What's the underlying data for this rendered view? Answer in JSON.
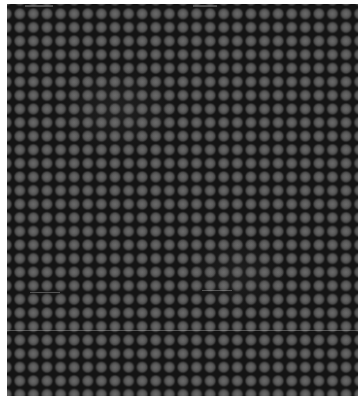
{
  "image": {
    "description": "Grayscale micrograph of a regular square array of round dots on a dark background",
    "grid": {
      "pitch_px": 13.6,
      "columns_visible": 26,
      "rows_visible": 29
    },
    "colors": {
      "background": "#141414",
      "dot": "#5c5c5c",
      "page": "#ffffff"
    }
  }
}
